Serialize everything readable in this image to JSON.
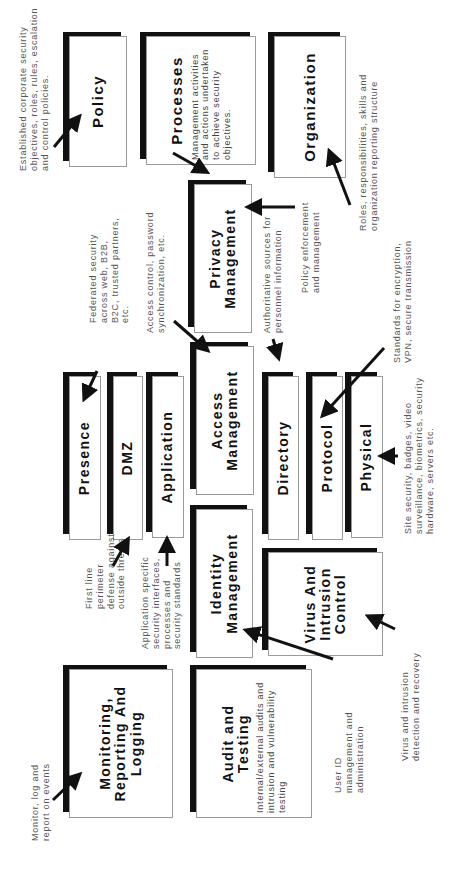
{
  "diagram": {
    "boxes": {
      "policy": {
        "title": "Policy"
      },
      "processes": {
        "title": "Processes",
        "subtitle": "Management activities and actions undertaken to achieve security objectives."
      },
      "organization": {
        "title": "Organization"
      },
      "privacy_management": {
        "title": "Privacy Management"
      },
      "presence": {
        "title": "Presence"
      },
      "dmz": {
        "title": "DMZ"
      },
      "application": {
        "title": "Application"
      },
      "access_management": {
        "title": "Access Management"
      },
      "directory": {
        "title": "Directory"
      },
      "protocol": {
        "title": "Protocol"
      },
      "physical": {
        "title": "Physical"
      },
      "identity_management": {
        "title": "Identity Management"
      },
      "virus_intrusion_control": {
        "title": "Virus And Intrusion Control"
      },
      "monitoring_reporting_logging": {
        "title": "Monitoring, Reporting And Logging"
      },
      "audit_testing": {
        "title": "Audit and Testing",
        "subtitle": "Internal/external audits and intrusion and vulnerability testing"
      }
    },
    "captions": {
      "policy": "Established corporate security\nobjectives, roles, rules, escalation\nand control policies.",
      "organization": "Roles, responsibilities, skills and\norganization reporting structure",
      "privacy": "Policy enforcement\nand management",
      "presence": "Federated security\nacross web, B2B,\nB2C, trusted partners,\netc.",
      "access": "Access control, password\nsynchronization, etc.",
      "directory": "Authoritative sources for\npersonnel information",
      "protocol": "Standards for encryption,\nVPN, secure transmission",
      "physical": "Site security, badges, video\nsurveillance, biometrics, security\nhardware, servers etc.",
      "dmz": "First line\nperimeter\ndefense against\noutside threats",
      "application": "Application specific\nsecurity interfaces,\nprocesses and\nsecurity standards",
      "virus": "Virus and intrusion\ndetection and recovery",
      "identity": "User ID\nmanagement and\nadministration",
      "monitoring": "Monitor, log and\nreport on events"
    }
  },
  "colors": {
    "shadow": "#111111",
    "caption": "#555555",
    "border": "#9a9a9a"
  }
}
